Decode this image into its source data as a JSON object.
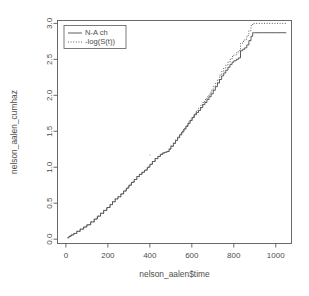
{
  "chart_data": {
    "type": "line",
    "title": "",
    "xlabel": "nelson_aalen$time",
    "ylabel": "nelson_aalen_cumhaz",
    "xlim": [
      -40,
      1075
    ],
    "ylim": [
      -0.06,
      3.04
    ],
    "xticks": [
      0,
      200,
      400,
      600,
      800,
      1000
    ],
    "xtick_labels": [
      "0",
      "200",
      "400",
      "600",
      "800",
      "1000"
    ],
    "yticks": [
      0.0,
      0.5,
      1.0,
      1.5,
      2.0,
      2.5,
      3.0
    ],
    "ytick_labels": [
      "0.0",
      "0.5",
      "1.0",
      "1.5",
      "2.0",
      "2.5",
      "3.0"
    ],
    "grid": false,
    "legend_position": "top-left",
    "legend": [
      "N-A ch",
      "-log(S(t))"
    ],
    "series": [
      {
        "name": "N-A ch",
        "style": "solid",
        "color": "#4a4a4a",
        "x": [
          8,
          15,
          25,
          38,
          52,
          68,
          85,
          100,
          118,
          135,
          150,
          165,
          180,
          195,
          210,
          222,
          235,
          248,
          262,
          275,
          288,
          300,
          312,
          325,
          338,
          350,
          362,
          375,
          388,
          400,
          412,
          425,
          438,
          450,
          462,
          472,
          482,
          492,
          500,
          512,
          522,
          532,
          542,
          552,
          562,
          572,
          582,
          592,
          602,
          612,
          622,
          632,
          642,
          652,
          662,
          672,
          682,
          692,
          702,
          712,
          722,
          732,
          742,
          752,
          762,
          772,
          782,
          792,
          800,
          812,
          822,
          832,
          842,
          852,
          862,
          872,
          882,
          890,
          900,
          940,
          1000,
          1050
        ],
        "y": [
          0.02,
          0.04,
          0.06,
          0.08,
          0.11,
          0.14,
          0.17,
          0.2,
          0.24,
          0.28,
          0.32,
          0.36,
          0.4,
          0.44,
          0.48,
          0.52,
          0.56,
          0.59,
          0.63,
          0.67,
          0.71,
          0.75,
          0.79,
          0.83,
          0.87,
          0.9,
          0.93,
          0.96,
          1.0,
          1.04,
          1.08,
          1.12,
          1.15,
          1.18,
          1.2,
          1.21,
          1.22,
          1.25,
          1.29,
          1.33,
          1.37,
          1.41,
          1.45,
          1.49,
          1.53,
          1.57,
          1.61,
          1.65,
          1.69,
          1.73,
          1.76,
          1.79,
          1.83,
          1.87,
          1.9,
          1.94,
          1.98,
          2.02,
          2.07,
          2.12,
          2.17,
          2.22,
          2.27,
          2.31,
          2.35,
          2.39,
          2.43,
          2.46,
          2.48,
          2.5,
          2.52,
          2.62,
          2.64,
          2.66,
          2.7,
          2.76,
          2.82,
          2.87,
          2.87,
          2.87,
          2.87,
          2.87
        ]
      },
      {
        "name": "-log(S(t))",
        "style": "dotted",
        "color": "#4a4a4a",
        "x": [
          8,
          15,
          25,
          38,
          52,
          68,
          85,
          100,
          118,
          135,
          150,
          165,
          180,
          195,
          210,
          222,
          235,
          248,
          262,
          275,
          288,
          300,
          312,
          325,
          338,
          350,
          362,
          375,
          388,
          400,
          412,
          425,
          438,
          450,
          462,
          472,
          482,
          492,
          500,
          512,
          522,
          532,
          542,
          552,
          562,
          572,
          582,
          592,
          602,
          612,
          622,
          632,
          642,
          652,
          662,
          672,
          682,
          692,
          702,
          712,
          722,
          732,
          742,
          752,
          762,
          772,
          782,
          792,
          800,
          812,
          822,
          832,
          842,
          852,
          862,
          872,
          882,
          890,
          900,
          940,
          1000,
          1050
        ],
        "y": [
          0.02,
          0.04,
          0.06,
          0.08,
          0.11,
          0.14,
          0.17,
          0.2,
          0.24,
          0.28,
          0.32,
          0.36,
          0.4,
          0.44,
          0.48,
          0.52,
          0.56,
          0.59,
          0.63,
          0.67,
          0.71,
          0.75,
          0.79,
          0.83,
          0.87,
          0.9,
          0.93,
          0.96,
          1.0,
          1.04,
          1.08,
          1.12,
          1.15,
          1.18,
          1.2,
          1.21,
          1.22,
          1.26,
          1.3,
          1.34,
          1.38,
          1.42,
          1.46,
          1.5,
          1.54,
          1.58,
          1.63,
          1.67,
          1.71,
          1.75,
          1.79,
          1.82,
          1.86,
          1.9,
          1.94,
          1.98,
          2.02,
          2.07,
          2.12,
          2.17,
          2.22,
          2.28,
          2.33,
          2.38,
          2.42,
          2.46,
          2.5,
          2.54,
          2.56,
          2.59,
          2.62,
          2.72,
          2.75,
          2.78,
          2.83,
          2.9,
          2.97,
          3.0,
          3.0,
          3.0,
          3.0,
          3.0
        ]
      }
    ]
  }
}
